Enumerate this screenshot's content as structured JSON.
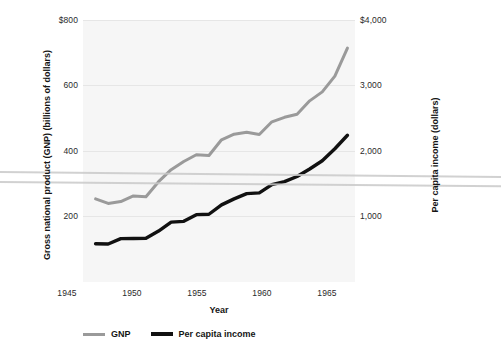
{
  "chart_data": {
    "type": "line",
    "title": "",
    "xlabel": "Year",
    "ylabel": "Gross national product (GNP) (billions of dollars)",
    "y2label": "Per capita income (dollars)",
    "xlim": [
      1944,
      1965.6
    ],
    "ylim": [
      100,
      800
    ],
    "y2lim": [
      500,
      4000
    ],
    "grid": true,
    "legend_position": "bottom",
    "xticks": [
      "1945",
      "1950",
      "1955",
      "1960",
      "1965"
    ],
    "xtick_values": [
      1945,
      1950,
      1955,
      1960,
      1965
    ],
    "yticks": [
      "$800",
      "600",
      "400",
      "200"
    ],
    "ytick_values": [
      800,
      600,
      400,
      200
    ],
    "y2ticks": [
      "$4,000",
      "3,000",
      "2,000",
      "1,000"
    ],
    "y2tick_values": [
      4000,
      3000,
      2000,
      1000
    ],
    "x": [
      1945,
      1946,
      1947,
      1948,
      1949,
      1950,
      1951,
      1952,
      1953,
      1954,
      1955,
      1956,
      1957,
      1958,
      1959,
      1960,
      1961,
      1962,
      1963,
      1964,
      1965
    ],
    "series": [
      {
        "name": "GNP",
        "axis": "left",
        "color": "#9a9a9a",
        "values": [
          322,
          310,
          315,
          330,
          328,
          368,
          400,
          422,
          440,
          438,
          480,
          495,
          500,
          494,
          528,
          540,
          548,
          584,
          608,
          650,
          725
        ]
      },
      {
        "name": "Per capita income",
        "axis": "right",
        "color": "#111111",
        "values": [
          1010,
          1008,
          1080,
          1082,
          1085,
          1180,
          1300,
          1310,
          1400,
          1405,
          1530,
          1610,
          1680,
          1690,
          1800,
          1840,
          1910,
          2010,
          2120,
          2280,
          2460
        ]
      }
    ],
    "legend": [
      {
        "label": "GNP",
        "color": "#9a9a9a"
      },
      {
        "label": "Per capita income",
        "color": "#111111"
      }
    ]
  },
  "axes": {
    "x_title": "Year",
    "y_left_title": "Gross national product (GNP) (billions of dollars)",
    "y_right_title": "Per capita income (dollars)"
  },
  "ticks": {
    "left": [
      "$800",
      "600",
      "400",
      "200"
    ],
    "right": [
      "$4,000",
      "3,000",
      "2,000",
      "1,000"
    ],
    "bottom": [
      "1945",
      "1950",
      "1955",
      "1960",
      "1965"
    ]
  },
  "legend": {
    "gnp_label": "GNP",
    "pci_label": "Per capita income"
  },
  "colors": {
    "gnp": "#9a9a9a",
    "per_capita_income": "#111111",
    "plot_background": "#f6f6f6",
    "gridline": "#e6e6e6"
  }
}
